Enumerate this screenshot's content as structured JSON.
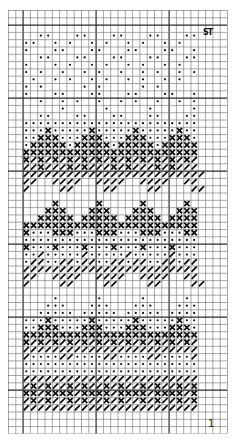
{
  "chart": {
    "type": "knitting-chart",
    "cols": 30,
    "rows": 58,
    "cell_px": 7.3,
    "major_every": 10,
    "colors": {
      "grid": "#6b6b6b",
      "major": "#2b2b2b",
      "ink": "#111111",
      "paper": "#ffffff"
    },
    "legend_symbols": {
      ".": "empty",
      "o": "dot",
      "x": "cross",
      "/": "slash"
    },
    "pattern_col_offset": 2,
    "pattern_rows": [
      "........................",
      "..oo...oo...oo...oo...oo",
      "oo..o.o..o.o..o.o..o.o..",
      "o...oo...oo...oo...oo..o",
      "..oo...oo...oo...oo...oo",
      "o...o.o..o.o..o.o..o.o..",
      "o.o..o..o.o..o..o.o..o.o",
      ".o..o.o..o.o..o.o..o.o..",
      "o.o.....o.o.....o.o.....",
      "o...oo...oo...oo...oo..o",
      "..o..o.o..o..o.o..o..o.o",
      ".....o.....o.....o.....o",
      "..oo...oo...oo...oo...oo",
      "oooooooooooooooooooooooo",
      "oooxoooooxoooooxoooooxoo",
      "ooxxxoooxxxoooxxxoooxxxo",
      "oxxxxxoxxxxxoxxxxxoxxxxx",
      "xxxxxxxxxxxxxxxxxxxxxxxx",
      "x/x/x/x/x/x/x/x/x/x/x/x/",
      "//x///x/x///x/x///x/x///",
      "/////////////////////////",
      "//..////..////..////..//",
      "/....//....//....//....//",
      "........................",
      "....x.....x.....x.....x.",
      "...xxx...xxx...xxx...xxx",
      "..xxxxx.xxxxx.xxxxx.xxxx",
      "xxxxxxxxxxxxxxxxxxxxxxxx",
      "xoooxxxoooxxxoooxxxoooxx",
      "oooooooooooooooooooooooo",
      "xoooxoooxoooxoooxoooxooo",
      "oo/ooooo/ooooo/ooooo/ooo",
      "o//oo//o//oo//o//oo//o//",
      "////////////////////////",
      "//..////..////..////..//",
      "/....//....//....//....//",
      "........................",
      "....o.....o.....o.....o.",
      "...ooo...ooo...ooo...ooo",
      "..ooooo.ooooo.ooooo.oooo",
      "oooxoooooxoooooxoooooxoo",
      "ooxxxoooxxxoooxxxoooxxxo",
      "xxxxxxxxxxxxxxxxxxxxxxxx",
      "x/x/x/x/x/x/x/x/x/x/x/x/",
      "////////////////////////",
      "/oooo//oooo//oooo//oooo/",
      "oooooooooooooooooooooooo",
      "oooooooooooooooooooooooo",
      "////////////////////////",
      "/x/x//x/x//x/x//x/x//x/x",
      "xx/xxxx/xxxx/xxxx/xxxx/x",
      "/x/x//x/x//x/x//x/x//x/x",
      "////////////////////////"
    ],
    "pattern_row_offset": 2
  },
  "annotations": {
    "top_right_mark": "ST",
    "bottom_right_number": "1"
  }
}
